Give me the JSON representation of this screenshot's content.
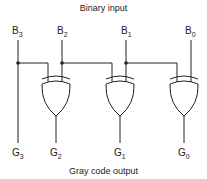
{
  "header": {
    "title": "Binary input"
  },
  "footer": {
    "title": "Gray code output"
  },
  "inputs": [
    {
      "letter": "B",
      "sub": "3"
    },
    {
      "letter": "B",
      "sub": "2"
    },
    {
      "letter": "B",
      "sub": "1"
    },
    {
      "letter": "B",
      "sub": "0"
    }
  ],
  "outputs": [
    {
      "letter": "G",
      "sub": "3"
    },
    {
      "letter": "G",
      "sub": "2"
    },
    {
      "letter": "G",
      "sub": "1"
    },
    {
      "letter": "G",
      "sub": "0"
    }
  ],
  "gates": [
    {
      "type": "XOR",
      "inputs": [
        "B3",
        "B2"
      ],
      "output": "G2"
    },
    {
      "type": "XOR",
      "inputs": [
        "B2",
        "B1"
      ],
      "output": "G1"
    },
    {
      "type": "XOR",
      "inputs": [
        "B1",
        "B0"
      ],
      "output": "G0"
    }
  ],
  "colors": {
    "line": "#222222",
    "background": "#ffffff"
  }
}
